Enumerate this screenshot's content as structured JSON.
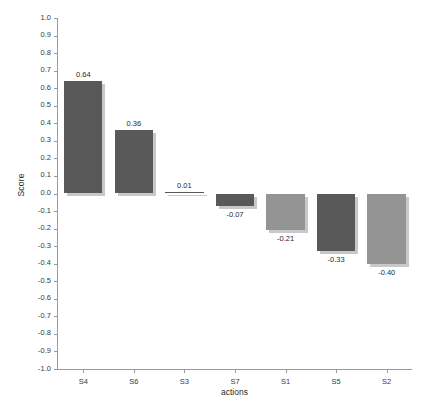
{
  "chart_data": {
    "type": "bar",
    "title": "",
    "xlabel": "actions",
    "ylabel": "Score",
    "categories": [
      "S4",
      "S6",
      "S3",
      "S7",
      "S1",
      "S5",
      "S2"
    ],
    "values": [
      0.64,
      0.36,
      0.01,
      -0.07,
      -0.21,
      -0.33,
      -0.4
    ],
    "value_labels": [
      "0.64",
      "0.36",
      "0.01",
      "-0.07",
      "-0.21",
      "-0.33",
      "-0.40"
    ],
    "bar_colors": [
      "#595959",
      "#595959",
      "#595959",
      "#595959",
      "#949494",
      "#595959",
      "#949494"
    ],
    "ylim": [
      -1.0,
      1.0
    ],
    "ytick_labels": [
      "1.0",
      "0.9",
      "0.8",
      "0.7",
      "0.6",
      "0.5",
      "0.4",
      "0.3",
      "0.2",
      "0.1",
      "0.0",
      "-0.1",
      "-0.2",
      "-0.3",
      "-0.4",
      "-0.5",
      "-0.6",
      "-0.7",
      "-0.8",
      "-0.9",
      "-1.0"
    ],
    "ytick_values": [
      1.0,
      0.9,
      0.8,
      0.7,
      0.6,
      0.5,
      0.4,
      0.3,
      0.2,
      0.1,
      0.0,
      -0.1,
      -0.2,
      -0.3,
      -0.4,
      -0.5,
      -0.6,
      -0.7,
      -0.8,
      -0.9,
      -1.0
    ],
    "grid": false,
    "legend": "none",
    "background_color": "#ffffff",
    "axis_color": "#9a9a9a"
  }
}
